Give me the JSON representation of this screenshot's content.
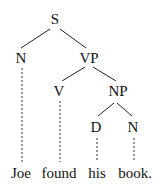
{
  "diagram": {
    "type": "syntax-tree",
    "nodes": {
      "s": "S",
      "n1": "N",
      "vp": "VP",
      "v": "V",
      "np": "NP",
      "d": "D",
      "n2": "N"
    },
    "words": [
      "Joe",
      "found",
      "his",
      "book."
    ]
  }
}
